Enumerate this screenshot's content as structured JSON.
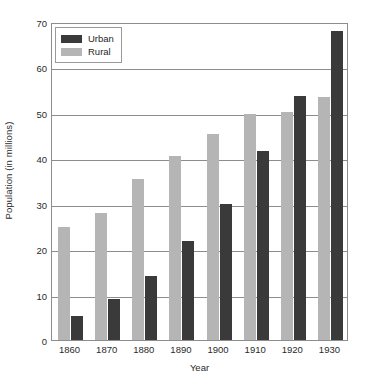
{
  "chart_data": {
    "type": "bar",
    "title": "",
    "xlabel": "Year",
    "ylabel": "Population (in millions)",
    "categories": [
      "1860",
      "1870",
      "1880",
      "1890",
      "1900",
      "1910",
      "1920",
      "1930"
    ],
    "series": [
      {
        "name": "Urban",
        "color": "#3a3a3a",
        "values": [
          5.2,
          9.1,
          14.0,
          21.7,
          29.9,
          41.5,
          53.8,
          68.0
        ]
      },
      {
        "name": "Rural",
        "color": "#b5b5b5",
        "values": [
          24.9,
          27.9,
          35.5,
          40.4,
          45.4,
          49.8,
          50.3,
          53.6
        ]
      }
    ],
    "ylim": [
      0,
      70
    ],
    "yticks": [
      0,
      10,
      20,
      30,
      40,
      50,
      60,
      70
    ],
    "ytick_labels": [
      "0",
      "10",
      "20",
      "30",
      "40",
      "50",
      "60",
      "70"
    ],
    "grid": true,
    "grid_axis": "y",
    "legend_position": "top-left",
    "legend_entries": [
      "Urban",
      "Rural"
    ],
    "bar_order_in_group": [
      "Rural",
      "Urban"
    ]
  }
}
